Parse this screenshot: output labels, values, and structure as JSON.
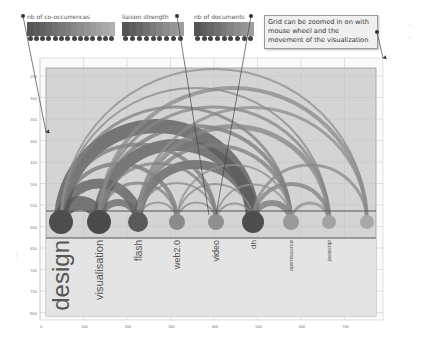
{
  "legends": [
    {
      "id": "co-occurrences",
      "title": "nb of co-occurrences",
      "x": 27,
      "y": 13,
      "w": 88,
      "colors": [
        "#555",
        "#5c5c5c",
        "#636363",
        "#6a6a6a",
        "#717171",
        "#787878",
        "#7f7f7f",
        "#868686",
        "#8d8d8d",
        "#949494",
        "#9b9b9b",
        "#a2a2a2",
        "#a9a9a9",
        "#b0b0b0"
      ]
    },
    {
      "id": "liaison-strength",
      "title": "liaison strength",
      "x": 122,
      "y": 13,
      "w": 62,
      "colors": [
        "#555",
        "#5e5e5e",
        "#676767",
        "#707070",
        "#7a7a7a",
        "#838383",
        "#8c8c8c",
        "#959595",
        "#9e9e9e"
      ]
    },
    {
      "id": "nb-documents",
      "title": "nb of documents",
      "x": 194,
      "y": 13,
      "w": 60,
      "colors": [
        "#555",
        "#5e5e5e",
        "#676767",
        "#707070",
        "#7a7a7a",
        "#838383",
        "#8c8c8c",
        "#959595",
        "#9e9e9e"
      ]
    }
  ],
  "note": {
    "text": "Grid can be zoomed in on with mouse wheel and the movement of the visualization"
  },
  "chart_data": {
    "type": "arc-diagram",
    "xaxis": {
      "ticks": [
        "0",
        "100",
        "200",
        "300",
        "400",
        "500",
        "600",
        "700"
      ]
    },
    "yaxis": {
      "ticks": [
        "250",
        "300",
        "350",
        "400",
        "450",
        "500",
        "550",
        "600",
        "650",
        "700",
        "750",
        "800"
      ]
    },
    "nodes": [
      {
        "label": "design",
        "x": 61,
        "r": 12,
        "color": "#4d4d4d",
        "font": 24
      },
      {
        "label": "visualisation",
        "x": 99,
        "r": 12,
        "color": "#4a4a4a",
        "font": 11
      },
      {
        "label": "flash",
        "x": 138,
        "r": 10,
        "color": "#5a5a5a",
        "font": 10
      },
      {
        "label": "web2.0",
        "x": 177,
        "r": 8,
        "color": "#8a8a8a",
        "font": 9
      },
      {
        "label": "video",
        "x": 216,
        "r": 8,
        "color": "#8f8f8f",
        "font": 9
      },
      {
        "label": "dh",
        "x": 253,
        "r": 11,
        "color": "#4e4e4e",
        "font": 8
      },
      {
        "label": "opensource",
        "x": 291,
        "r": 8,
        "color": "#9a9a9a",
        "font": 6
      },
      {
        "label": "javascript",
        "x": 329,
        "r": 7,
        "color": "#a2a2a2",
        "font": 5
      },
      {
        "label": "",
        "x": 367,
        "r": 7,
        "color": "#a8a8a8",
        "font": 5
      }
    ],
    "links": [
      {
        "a": 0,
        "b": 1,
        "w": 14,
        "c": "#555"
      },
      {
        "a": 0,
        "b": 2,
        "w": 10,
        "c": "#5a5a5a"
      },
      {
        "a": 0,
        "b": 5,
        "w": 14,
        "c": "#555"
      },
      {
        "a": 1,
        "b": 5,
        "w": 12,
        "c": "#5a5a5a"
      },
      {
        "a": 2,
        "b": 5,
        "w": 9,
        "c": "#5f5f5f"
      },
      {
        "a": 1,
        "b": 2,
        "w": 7,
        "c": "#666"
      },
      {
        "a": 0,
        "b": 3,
        "w": 4,
        "c": "#777"
      },
      {
        "a": 0,
        "b": 4,
        "w": 4,
        "c": "#7a7a7a"
      },
      {
        "a": 0,
        "b": 6,
        "w": 3,
        "c": "#808080"
      },
      {
        "a": 0,
        "b": 7,
        "w": 2,
        "c": "#888"
      },
      {
        "a": 0,
        "b": 8,
        "w": 2,
        "c": "#8e8e8e"
      },
      {
        "a": 1,
        "b": 6,
        "w": 4,
        "c": "#7a7a7a"
      },
      {
        "a": 1,
        "b": 7,
        "w": 3,
        "c": "#858585"
      },
      {
        "a": 1,
        "b": 8,
        "w": 4,
        "c": "#8a8a8a"
      },
      {
        "a": 2,
        "b": 6,
        "w": 4,
        "c": "#7f7f7f"
      },
      {
        "a": 2,
        "b": 7,
        "w": 5,
        "c": "#858585"
      },
      {
        "a": 2,
        "b": 8,
        "w": 3,
        "c": "#8c8c8c"
      },
      {
        "a": 5,
        "b": 6,
        "w": 6,
        "c": "#777"
      },
      {
        "a": 5,
        "b": 7,
        "w": 4,
        "c": "#808080"
      },
      {
        "a": 5,
        "b": 8,
        "w": 3,
        "c": "#8a8a8a"
      },
      {
        "a": 6,
        "b": 7,
        "w": 3,
        "c": "#909090"
      },
      {
        "a": 3,
        "b": 4,
        "w": 2,
        "c": "#888"
      },
      {
        "a": 2,
        "b": 3,
        "w": 2,
        "c": "#888"
      },
      {
        "a": 3,
        "b": 5,
        "w": 2,
        "c": "#8a8a8a"
      },
      {
        "a": 4,
        "b": 5,
        "w": 2,
        "c": "#8a8a8a"
      },
      {
        "a": 2,
        "b": 4,
        "w": 2,
        "c": "#8a8a8a"
      },
      {
        "a": 3,
        "b": 6,
        "w": 2,
        "c": "#909090"
      },
      {
        "a": 4,
        "b": 6,
        "w": 2,
        "c": "#909090"
      },
      {
        "a": 1,
        "b": 3,
        "w": 3,
        "c": "#808080"
      },
      {
        "a": 1,
        "b": 4,
        "w": 3,
        "c": "#808080"
      }
    ]
  }
}
